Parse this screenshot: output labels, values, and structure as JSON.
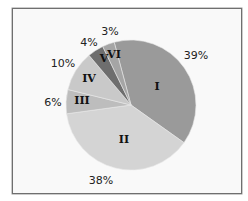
{
  "chart_data": {
    "type": "pie",
    "title": "",
    "categories": [
      "I",
      "II",
      "III",
      "IV",
      "V",
      "VI"
    ],
    "values": [
      39,
      38,
      6,
      10,
      4,
      3
    ],
    "labels": [
      "39%",
      "38%",
      "6%",
      "10%",
      "4%",
      "3%"
    ],
    "colors": [
      "#9a9a9a",
      "#d4d4d4",
      "#bdbdbd",
      "#c9c9c9",
      "#6e6e6e",
      "#a5a5a5"
    ],
    "start_angle_deg": -15,
    "direction": "clockwise",
    "legend": "none",
    "data_labels": "percent outside, category name inside"
  },
  "slices": [
    {
      "name": "I",
      "pct": "39%"
    },
    {
      "name": "II",
      "pct": "38%"
    },
    {
      "name": "III",
      "pct": "6%"
    },
    {
      "name": "IV",
      "pct": "10%"
    },
    {
      "name": "V",
      "pct": "4%"
    },
    {
      "name": "VI",
      "pct": "3%"
    }
  ]
}
